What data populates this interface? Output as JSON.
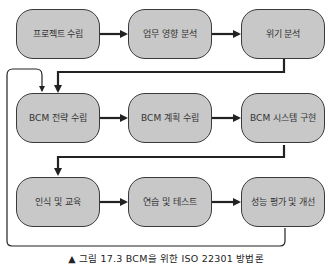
{
  "diagram": {
    "steps": [
      {
        "label": "프로젝트 수립"
      },
      {
        "label": "업무 영향 분석"
      },
      {
        "label": "위기 분석"
      },
      {
        "label": "BCM 전략 수립"
      },
      {
        "label": "BCM 계획 수립"
      },
      {
        "label": "BCM 시스템 구현"
      },
      {
        "label": "인식 및 교육"
      },
      {
        "label": "연습 및 테스트"
      },
      {
        "label": "성능 평가 및 개선"
      }
    ],
    "flow": "left-to-right rows, row end connects to next row start; final step loops back to BCM 전략 수립",
    "colors": {
      "box_fill": "#c8c8c8",
      "stroke": "#2a2a2a"
    }
  },
  "caption": "▲ 그림 17.3 BCM을 위한 ISO 22301 방법론"
}
